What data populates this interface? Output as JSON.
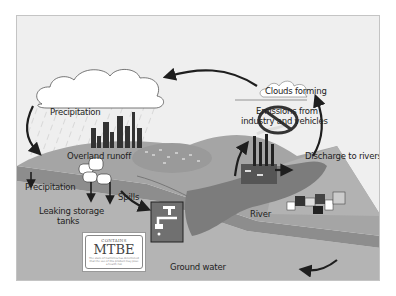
{
  "diagram": {
    "labels": {
      "precipitation_sky": "Precipitation",
      "clouds_forming": "Clouds forming",
      "emissions": "Emissions from industry and vehicles",
      "emissions_line1": "Emissions from",
      "emissions_line2": "industry and vehicles",
      "overland_runoff": "Overland runoff",
      "discharge": "Discharge to rivers",
      "precipitation_ground": "Precipitation",
      "spills": "Spills",
      "leaking_tanks_line1": "Leaking storage",
      "leaking_tanks_line2": "tanks",
      "river": "River",
      "ground_water": "Ground water"
    },
    "mtbe_sign": {
      "top": "CONTAINS",
      "main": "MTBE",
      "fine_print": "The state of California has determined that the use of this product may pose a health risk"
    },
    "icons": [
      "cloud-icon",
      "rain-icon",
      "city-skyline-icon",
      "storage-tanks-icon",
      "factory-icon",
      "no-symbol-icon",
      "faucet-well-icon",
      "houses-icon",
      "arrow-icon"
    ],
    "colors": {
      "background": "#efefef",
      "land_top": "#a9a9a9",
      "land_layer": "#8a8a8a",
      "ground": "#b5b5b5",
      "river": "#7a7a7a",
      "dark": "#222222"
    }
  }
}
